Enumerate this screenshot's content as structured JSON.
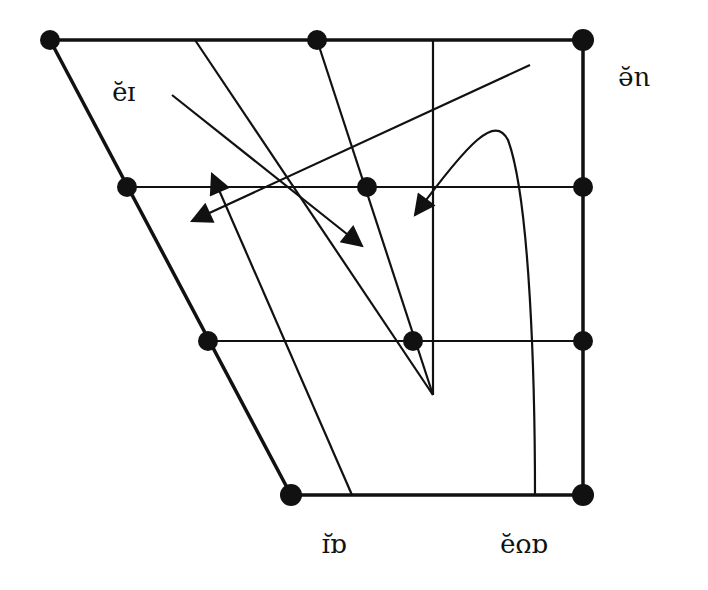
{
  "diagram": {
    "type": "vowel-trapezoid-diphthong-chart",
    "orientation": "rotated-180",
    "colors": {
      "ink": "#111111",
      "background": "#ffffff"
    },
    "labels": [
      {
        "id": "label-ei",
        "text": "ɪə̯",
        "display": "ɪə̯",
        "x": 112,
        "y": 83
      },
      {
        "id": "label-ue",
        "text": "eu̯",
        "display": "ue̯",
        "x": 618,
        "y": 68
      },
      {
        "id": "label-ai",
        "text": "ɪ̯ɑ",
        "display": "ɑɪ̯",
        "x": 322,
        "y": 535
      },
      {
        "id": "label-auo",
        "text": "ə̯ʊɑ",
        "display": "ɑʊə̯",
        "x": 505,
        "y": 535
      }
    ],
    "dots": [
      [
        50,
        40
      ],
      [
        317,
        40
      ],
      [
        583,
        40
      ],
      [
        127,
        187
      ],
      [
        367,
        187
      ],
      [
        583,
        187
      ],
      [
        208,
        341
      ],
      [
        413,
        341
      ],
      [
        583,
        341
      ],
      [
        291,
        495
      ],
      [
        583,
        495
      ]
    ]
  }
}
